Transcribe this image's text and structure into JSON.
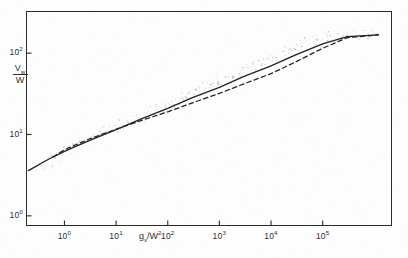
{
  "figure": {
    "background_color": "#fdfdfd",
    "ink_color": "#2b2b2b",
    "width": 408,
    "height": 258
  },
  "chart_data": {
    "type": "line",
    "title": "",
    "subtitle": "",
    "xlabel": "gx/W²",
    "ylabel": "Vw/W",
    "xscale": "log",
    "yscale": "log",
    "grid": false,
    "legend": "none",
    "xlim": [
      0.18,
      2200000
    ],
    "ylim": [
      0.75,
      330
    ],
    "xtick_labels": [
      "10",
      "10",
      "10",
      "10",
      "10",
      "10"
    ],
    "xtick_exponents": [
      "0",
      "1",
      "2",
      "3",
      "4",
      "5"
    ],
    "xtick_values": [
      1,
      10,
      100,
      1000,
      10000,
      100000
    ],
    "ytick_labels": [
      "10",
      "10",
      "10"
    ],
    "ytick_exponents": [
      "0",
      "1",
      "2"
    ],
    "ytick_values": [
      1,
      10,
      100
    ],
    "series": [
      {
        "name": "solid-curve",
        "style": "solid",
        "color": "#232323",
        "x": [
          0.2,
          0.5,
          1,
          3,
          10,
          30,
          100,
          300,
          1000,
          3000,
          10000,
          30000,
          100000,
          300000,
          1200000
        ],
        "y": [
          3.6,
          5.0,
          6.2,
          8.4,
          11.5,
          15.5,
          21.0,
          28.5,
          38.0,
          52.0,
          70.0,
          95.0,
          130.0,
          160.0,
          168.0
        ]
      },
      {
        "name": "dashed-curve",
        "style": "dashed",
        "color": "#232323",
        "x": [
          0.6,
          1,
          3,
          10,
          30,
          100,
          300,
          1000,
          3000,
          10000,
          30000,
          100000,
          300000,
          1200000
        ],
        "y": [
          5.3,
          6.5,
          8.8,
          11.6,
          14.8,
          19.0,
          24.5,
          32.0,
          42.0,
          56.0,
          78.0,
          115.0,
          155.0,
          168.0
        ]
      }
    ],
    "scatter": {
      "name": "data-points",
      "color": "#9a9a9a",
      "marker": "dot",
      "description": "faint cloud of measured points scattered along the curves",
      "x": [
        0.35,
        0.45,
        0.6,
        0.7,
        0.9,
        1.1,
        1.4,
        1.8,
        2.3,
        2.9,
        3.6,
        4.5,
        5.8,
        7.2,
        9.0,
        11,
        14,
        18,
        23,
        29,
        36,
        45,
        58,
        72,
        90,
        115,
        145,
        185,
        230,
        290,
        360,
        460,
        580,
        720,
        900,
        1150,
        1450,
        1850,
        2300,
        2900,
        3600,
        4600,
        5800,
        7200,
        9000,
        12000,
        15000,
        19000,
        24000,
        30000,
        38000,
        48000,
        60000,
        76000,
        95000,
        120000,
        150000,
        190000,
        240000,
        300000,
        380000,
        480000,
        600000,
        760000,
        950000
      ],
      "y": [
        4.2,
        4.6,
        5.1,
        5.4,
        5.9,
        6.3,
        6.8,
        7.4,
        8.0,
        8.6,
        9.2,
        9.9,
        10.6,
        11.3,
        12.0,
        12.6,
        13.5,
        14.4,
        15.4,
        16.4,
        17.5,
        18.7,
        20.0,
        21.4,
        22.8,
        24.4,
        26.0,
        27.8,
        29.6,
        31.6,
        33.7,
        36.0,
        38.4,
        41.0,
        43.7,
        46.6,
        49.7,
        53.0,
        56.5,
        60.3,
        64.3,
        68.6,
        73.1,
        78.0,
        83.2,
        89.0,
        95.0,
        101.0,
        108.0,
        115.0,
        122.0,
        130.0,
        138.0,
        146.0,
        152.0,
        158.0,
        162.0,
        165.0,
        167.0,
        168.0,
        168.5,
        169.0,
        169.0,
        169.0,
        169.0
      ]
    }
  }
}
